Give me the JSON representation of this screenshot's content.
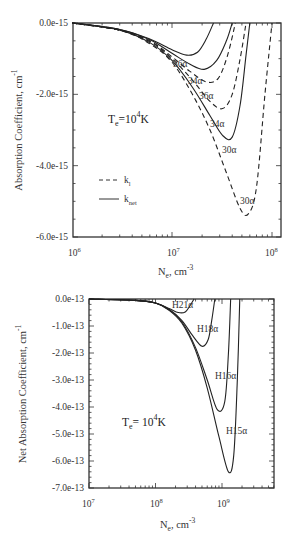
{
  "chart_data": [
    {
      "type": "line",
      "title": "",
      "xlabel": "N_e, cm^-3",
      "ylabel": "Absorption Coefficient, cm^-1",
      "xscale": "log",
      "xlim": [
        1000000.0,
        125000000.0
      ],
      "ylim": [
        -6e-15,
        0.0
      ],
      "xticks": [
        "10^6",
        "10^7",
        "10^8"
      ],
      "yticks": [
        "0.0e-15",
        "-2.0e-15",
        "-4.0e-15",
        "-6.0e-15"
      ],
      "annotation": "T_e = 10^4 K",
      "legend": [
        {
          "label": "k_l",
          "style": "dashed"
        },
        {
          "label": "k_net",
          "style": "solid"
        }
      ],
      "legend_position": "left-middle",
      "grid": false,
      "series": [
        {
          "name": "36α k_net",
          "style": "solid",
          "label": "36α",
          "x": [
            1000000.0,
            3000000.0,
            6000000.0,
            10000000.0,
            14000000.0,
            18000000.0,
            22000000.0,
            26000000.0
          ],
          "y": [
            0,
            -1.8e-16,
            -4.5e-16,
            -7.5e-16,
            -9e-16,
            -8.2e-16,
            -4.5e-16,
            0
          ]
        },
        {
          "name": "34α k_net",
          "style": "solid",
          "label": "34α",
          "x": [
            1000000.0,
            3000000.0,
            6000000.0,
            10000000.0,
            15000000.0,
            21000000.0,
            28000000.0,
            35000000.0,
            40000000.0
          ],
          "y": [
            0,
            -1.8e-16,
            -4.7e-16,
            -8.5e-16,
            -1.15e-15,
            -1.3e-15,
            -1.05e-15,
            -5e-16,
            0
          ]
        },
        {
          "name": "36α k_l",
          "style": "dashed",
          "label": "36α",
          "x": [
            1000000.0,
            3000000.0,
            6000000.0,
            10000000.0,
            15000000.0,
            22000000.0,
            29000000.0,
            36000000.0,
            43000000.0
          ],
          "y": [
            0,
            -2e-16,
            -5e-16,
            -9.5e-16,
            -1.35e-15,
            -1.65e-15,
            -1.55e-15,
            -9e-16,
            0
          ]
        },
        {
          "name": "34α k_l",
          "style": "dashed",
          "label": "34α",
          "x": [
            1000000.0,
            3000000.0,
            6000000.0,
            10000000.0,
            16000000.0,
            24000000.0,
            32000000.0,
            40000000.0,
            48000000.0,
            55000000.0
          ],
          "y": [
            0,
            -2e-16,
            -5.2e-16,
            -1e-15,
            -1.6e-15,
            -2.2e-15,
            -2.4e-15,
            -2e-15,
            -1e-15,
            0
          ]
        },
        {
          "name": "30α k_net",
          "style": "solid",
          "label": "30α",
          "x": [
            1000000.0,
            3000000.0,
            6000000.0,
            10000000.0,
            16000000.0,
            24000000.0,
            32000000.0,
            40000000.0,
            48000000.0,
            55000000.0,
            60000000.0
          ],
          "y": [
            0,
            -2e-16,
            -5.5e-16,
            -1.05e-15,
            -1.8e-15,
            -2.6e-15,
            -3.15e-15,
            -3.2e-15,
            -2.3e-15,
            -9e-16,
            0
          ]
        },
        {
          "name": "30α k_l",
          "style": "dashed",
          "label": "30α",
          "x": [
            1000000.0,
            3000000.0,
            6000000.0,
            10000000.0,
            16000000.0,
            24000000.0,
            35000000.0,
            48000000.0,
            58000000.0,
            70000000.0,
            85000000.0,
            100000000.0
          ],
          "y": [
            0,
            -2e-16,
            -5.8e-16,
            -1.1e-15,
            -2e-15,
            -3e-15,
            -4.2e-15,
            -5.2e-15,
            -5.35e-15,
            -4.6e-15,
            -2e-15,
            0
          ]
        }
      ]
    },
    {
      "type": "line",
      "title": "",
      "xlabel": "N_e, cm^-3",
      "ylabel": "Net Absorption Coefficient, cm^-1",
      "xscale": "log",
      "xlim": [
        10000000.0,
        6000000000.0
      ],
      "ylim": [
        -7e-13,
        0.0
      ],
      "xticks": [
        "10^7",
        "10^8",
        "10^9"
      ],
      "yticks": [
        "0.0e-13",
        "-1.0e-13",
        "-2.0e-13",
        "-3.0e-13",
        "-4.0e-13",
        "-5.0e-13",
        "-6.0e-13",
        "-7.0e-13"
      ],
      "annotation": "T_e = 10^4 K",
      "grid": false,
      "series": [
        {
          "name": "H21α",
          "style": "solid",
          "label": "H21α",
          "x": [
            10000000.0,
            50000000.0,
            100000000.0,
            160000000.0,
            220000000.0,
            280000000.0,
            330000000.0,
            380000000.0
          ],
          "y": [
            0,
            -5e-15,
            -1.5e-14,
            -3.5e-14,
            -5e-14,
            -4.8e-14,
            -2.5e-14,
            0
          ]
        },
        {
          "name": "H18α",
          "style": "solid",
          "label": "H18α",
          "x": [
            10000000.0,
            50000000.0,
            100000000.0,
            160000000.0,
            250000000.0,
            360000000.0,
            500000000.0,
            620000000.0,
            700000000.0,
            780000000.0
          ],
          "y": [
            0,
            -5e-15,
            -1.5e-14,
            -3.8e-14,
            -8e-14,
            -1.35e-13,
            -1.75e-13,
            -1.5e-13,
            -8e-14,
            0
          ]
        },
        {
          "name": "H16α",
          "style": "solid",
          "label": "H16α",
          "x": [
            10000000.0,
            50000000.0,
            100000000.0,
            160000000.0,
            250000000.0,
            400000000.0,
            600000000.0,
            850000000.0,
            1100000000.0,
            1250000000.0,
            1350000000.0
          ],
          "y": [
            0,
            -5e-15,
            -1.5e-14,
            -4e-14,
            -8.5e-14,
            -1.8e-13,
            -3e-13,
            -4.1e-13,
            -3.8e-13,
            -2e-13,
            0
          ]
        },
        {
          "name": "H15α",
          "style": "solid",
          "label": "H15α",
          "x": [
            10000000.0,
            50000000.0,
            100000000.0,
            160000000.0,
            250000000.0,
            400000000.0,
            600000000.0,
            900000000.0,
            1250000000.0,
            1500000000.0,
            1700000000.0,
            1850000000.0
          ],
          "y": [
            0,
            -5e-15,
            -1.5e-14,
            -4.2e-14,
            -9e-14,
            -1.9e-13,
            -3.3e-13,
            -5.1e-13,
            -6.4e-13,
            -5.8e-13,
            -3e-13,
            0
          ]
        }
      ]
    }
  ],
  "top": {
    "yticks": [
      "0.0e-15",
      "-2.0e-15",
      "-4.0e-15",
      "-6.0e-15"
    ],
    "xticks": [
      "10",
      "10",
      "10"
    ],
    "xtick_exps": [
      "6",
      "7",
      "8"
    ],
    "ylabel": "Absorption Coefficient, cm",
    "ylabel_exp": "-1",
    "xlabel_main": "N",
    "xlabel_sub": "e",
    "xlabel_rest": ", cm",
    "xlabel_exp": "-3",
    "annot_T": "T",
    "annot_sub": "e",
    "annot_eq": "=10",
    "annot_exp": "4",
    "annot_K": "K",
    "legend_k": "k",
    "legend_l_sub": "l",
    "legend_net_sub": "net",
    "labels": [
      "36α",
      "34α",
      "36α",
      "34α",
      "30α",
      "30α"
    ]
  },
  "bottom": {
    "yticks": [
      "0.0e-13",
      "-1.0e-13",
      "-2.0e-13",
      "-3.0e-13",
      "-4.0e-13",
      "-5.0e-13",
      "-6.0e-13",
      "-7.0e-13"
    ],
    "xticks": [
      "10",
      "10",
      "10"
    ],
    "xtick_exps": [
      "7",
      "8",
      "9"
    ],
    "ylabel": "Net Absorption Coefficient, cm",
    "ylabel_exp": "-1",
    "xlabel_main": "N",
    "xlabel_sub": "e",
    "xlabel_rest": ", cm",
    "xlabel_exp": "-3",
    "annot_T": "T",
    "annot_sub": "e",
    "annot_eq": "= 10",
    "annot_exp": "4",
    "annot_K": "K",
    "labels": [
      "H21α",
      "H18α",
      "H16α",
      "H15α"
    ]
  }
}
